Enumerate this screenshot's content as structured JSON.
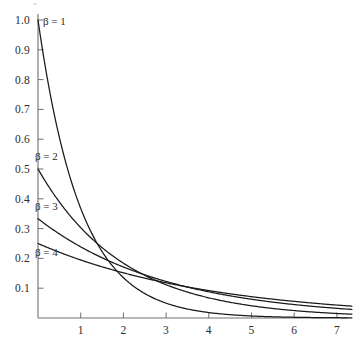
{
  "figure": {
    "background_color": "#ffffff",
    "curve_color": "#1a1a1a",
    "axis_color": "#6f6f6f",
    "text_color": "#2b2b2b"
  },
  "axes": {
    "x": {
      "label": "",
      "ticks": [
        "1",
        "2",
        "3",
        "4",
        "5",
        "6",
        "7"
      ],
      "tick_values": [
        1,
        2,
        3,
        4,
        5,
        6,
        7
      ],
      "range": [
        0,
        7.35
      ]
    },
    "y": {
      "label": "",
      "ticks": [
        "0.1",
        "0.2",
        "0.3",
        "0.4",
        "0.5",
        "0.6",
        "0.7",
        "0.8",
        "0.9",
        "1.0"
      ],
      "tick_values": [
        0.1,
        0.2,
        0.3,
        0.4,
        0.5,
        0.6,
        0.7,
        0.8,
        0.9,
        1.0
      ],
      "range": [
        0,
        1.0
      ]
    }
  },
  "curve_labels": [
    {
      "text": "β = 1",
      "beta": 1
    },
    {
      "text": "β = 2",
      "beta": 2
    },
    {
      "text": "β = 3",
      "beta": 3
    },
    {
      "text": "β = 4",
      "beta": 4
    }
  ],
  "chart_data": {
    "type": "line",
    "title": "",
    "subtitle": "",
    "xlabel": "",
    "ylabel": "",
    "xlim": [
      0,
      7.35
    ],
    "ylim": [
      0,
      1.0
    ],
    "grid": false,
    "legend_position": "inline-curve-labels",
    "annotations": [
      "β = 1",
      "β = 2",
      "β = 3",
      "β = 4"
    ],
    "x": [
      0,
      0.25,
      0.5,
      0.75,
      1,
      1.25,
      1.5,
      1.75,
      2,
      2.25,
      2.5,
      2.75,
      3,
      3.25,
      3.5,
      3.75,
      4,
      4.25,
      4.5,
      4.75,
      5,
      5.25,
      5.5,
      5.75,
      6,
      6.25,
      6.5,
      6.75,
      7
    ],
    "series": [
      {
        "name": "β = 1",
        "beta": 1,
        "values": [
          1.0,
          0.779,
          0.607,
          0.472,
          0.368,
          0.287,
          0.223,
          0.174,
          0.135,
          0.105,
          0.082,
          0.064,
          0.05,
          0.039,
          0.03,
          0.024,
          0.018,
          0.014,
          0.011,
          0.009,
          0.007,
          0.005,
          0.004,
          0.003,
          0.002,
          0.002,
          0.0015,
          0.0012,
          0.0009
        ]
      },
      {
        "name": "β = 2",
        "beta": 2,
        "values": [
          0.5,
          0.441,
          0.389,
          0.344,
          0.303,
          0.268,
          0.236,
          0.208,
          0.184,
          0.162,
          0.143,
          0.126,
          0.112,
          0.099,
          0.087,
          0.077,
          0.068,
          0.06,
          0.053,
          0.046,
          0.041,
          0.036,
          0.032,
          0.028,
          0.025,
          0.022,
          0.019,
          0.017,
          0.015
        ]
      },
      {
        "name": "β = 3",
        "beta": 3,
        "values": [
          0.333,
          0.307,
          0.282,
          0.26,
          0.239,
          0.22,
          0.202,
          0.186,
          0.171,
          0.157,
          0.145,
          0.133,
          0.123,
          0.113,
          0.104,
          0.095,
          0.088,
          0.081,
          0.074,
          0.068,
          0.063,
          0.058,
          0.053,
          0.049,
          0.045,
          0.041,
          0.038,
          0.035,
          0.032
        ]
      },
      {
        "name": "β = 4",
        "beta": 4,
        "values": [
          0.25,
          0.235,
          0.221,
          0.207,
          0.195,
          0.183,
          0.172,
          0.161,
          0.152,
          0.142,
          0.134,
          0.126,
          0.118,
          0.111,
          0.104,
          0.098,
          0.092,
          0.086,
          0.081,
          0.076,
          0.072,
          0.067,
          0.063,
          0.059,
          0.056,
          0.052,
          0.049,
          0.046,
          0.043
        ]
      }
    ]
  }
}
